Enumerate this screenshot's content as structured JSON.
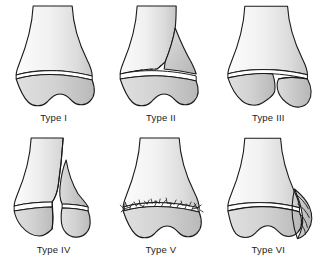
{
  "figure": {
    "background_color": "#ffffff",
    "line_color": "#1a1a1a",
    "label_color": "#1c1c1c",
    "columns": 3,
    "rows": 2
  },
  "palette": {
    "outline": "#1a1a1a",
    "metaphysis_light": "#fdfdfd",
    "metaphysis_mid": "#e9e9e9",
    "metaphysis_shadow": "#c9c9c9",
    "epiphysis_light": "#e3e3e3",
    "epiphysis_mid": "#cfcfcf",
    "epiphysis_shadow": "#b4b4b4",
    "physis_gap": "#ffffff",
    "fragment_fill": "#d2d2d2"
  },
  "panels": [
    {
      "id": "type-1",
      "label": "Type I",
      "numeral": "I",
      "description": "Transverse fracture straight through the growth plate; epiphysis separated from metaphysis with no bone fragment.",
      "fracture_path": "physis only"
    },
    {
      "id": "type-2",
      "label": "Type II",
      "numeral": "II",
      "description": "Fracture through the growth plate exiting into the metaphysis, producing a triangular metaphyseal wedge fragment.",
      "fracture_path": "physis + metaphysis"
    },
    {
      "id": "type-3",
      "label": "Type III",
      "numeral": "III",
      "description": "Fracture through the growth plate exiting through the epiphysis into the joint; epiphyseal fragment displaced.",
      "fracture_path": "physis + epiphysis"
    },
    {
      "id": "type-4",
      "label": "Type IV",
      "numeral": "IV",
      "description": "Vertical fracture crossing metaphysis, growth plate and epiphysis as a single line.",
      "fracture_path": "metaphysis + physis + epiphysis"
    },
    {
      "id": "type-5",
      "label": "Type V",
      "numeral": "V",
      "description": "Crush or compression injury of the growth plate shown as a jagged comminuted physeal line.",
      "fracture_path": "physeal compression"
    },
    {
      "id": "type-6",
      "label": "Type VI",
      "numeral": "VI",
      "description": "Peripheral injury to the perichondral ring at the margin of the growth plate, shown as a lateral flap.",
      "fracture_path": "perichondral ring"
    }
  ]
}
